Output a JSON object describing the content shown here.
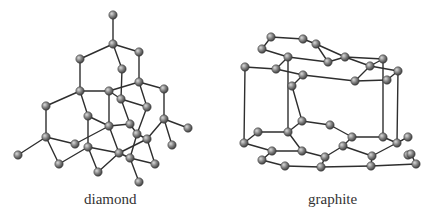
{
  "figure": {
    "panels": [
      {
        "id": "diamond",
        "label": "diamond",
        "atoms": [
          [
            113,
            15
          ],
          [
            113,
            44
          ],
          [
            80,
            59
          ],
          [
            139,
            52
          ],
          [
            122,
            69
          ],
          [
            80,
            91
          ],
          [
            109,
            91
          ],
          [
            139,
            82
          ],
          [
            164,
            89
          ],
          [
            46,
            106
          ],
          [
            121,
            99
          ],
          [
            147,
            107
          ],
          [
            88,
            116
          ],
          [
            109,
            126
          ],
          [
            130,
            124
          ],
          [
            164,
            119
          ],
          [
            188,
            128
          ],
          [
            46,
            137
          ],
          [
            75,
            144
          ],
          [
            88,
            147
          ],
          [
            137,
            134
          ],
          [
            18,
            155
          ],
          [
            119,
            153
          ],
          [
            147,
            139
          ],
          [
            172,
            145
          ],
          [
            59,
            164
          ],
          [
            130,
            158
          ],
          [
            98,
            172
          ],
          [
            155,
            164
          ],
          [
            139,
            182
          ]
        ],
        "bonds": [
          [
            0,
            1
          ],
          [
            1,
            2
          ],
          [
            1,
            3
          ],
          [
            1,
            4
          ],
          [
            2,
            5
          ],
          [
            3,
            7
          ],
          [
            4,
            10
          ],
          [
            5,
            6
          ],
          [
            5,
            9
          ],
          [
            5,
            12
          ],
          [
            7,
            8
          ],
          [
            7,
            11
          ],
          [
            7,
            6
          ],
          [
            6,
            13
          ],
          [
            10,
            11
          ],
          [
            10,
            14
          ],
          [
            10,
            6
          ],
          [
            8,
            15
          ],
          [
            9,
            17
          ],
          [
            12,
            19
          ],
          [
            12,
            13
          ],
          [
            11,
            20
          ],
          [
            15,
            16
          ],
          [
            15,
            24
          ],
          [
            15,
            23
          ],
          [
            13,
            14
          ],
          [
            13,
            22
          ],
          [
            17,
            21
          ],
          [
            17,
            18
          ],
          [
            17,
            25
          ],
          [
            18,
            13
          ],
          [
            19,
            22
          ],
          [
            19,
            27
          ],
          [
            20,
            23
          ],
          [
            20,
            26
          ],
          [
            22,
            23
          ],
          [
            22,
            27
          ],
          [
            22,
            26
          ],
          [
            23,
            28
          ],
          [
            25,
            19
          ],
          [
            26,
            29
          ],
          [
            26,
            28
          ],
          [
            14,
            20
          ]
        ]
      },
      {
        "id": "graphite",
        "label": "graphite",
        "atoms": [
          [
            271,
            37
          ],
          [
            303,
            39
          ],
          [
            262,
            49
          ],
          [
            288,
            57
          ],
          [
            316,
            44
          ],
          [
            328,
            62
          ],
          [
            345,
            57
          ],
          [
            370,
            66
          ],
          [
            383,
            59
          ],
          [
            303,
            75
          ],
          [
            292,
            86
          ],
          [
            245,
            67
          ],
          [
            276,
            69
          ],
          [
            355,
            81
          ],
          [
            387,
            80
          ],
          [
            398,
            71
          ],
          [
            302,
            121
          ],
          [
            330,
            125
          ],
          [
            258,
            132
          ],
          [
            288,
            132
          ],
          [
            352,
            137
          ],
          [
            383,
            137
          ],
          [
            244,
            143
          ],
          [
            272,
            151
          ],
          [
            302,
            151
          ],
          [
            343,
            146
          ],
          [
            397,
            143
          ],
          [
            408,
            137
          ],
          [
            262,
            160
          ],
          [
            285,
            166
          ],
          [
            325,
            157
          ],
          [
            372,
            156
          ],
          [
            408,
            155
          ],
          [
            371,
            166
          ],
          [
            321,
            167
          ],
          [
            411,
            154
          ],
          [
            416,
            164
          ]
        ],
        "bonds": [
          [
            0,
            1
          ],
          [
            0,
            2
          ],
          [
            1,
            4
          ],
          [
            2,
            3
          ],
          [
            4,
            5
          ],
          [
            3,
            5
          ],
          [
            3,
            12
          ],
          [
            5,
            6
          ],
          [
            6,
            8
          ],
          [
            4,
            6
          ],
          [
            8,
            7
          ],
          [
            7,
            13
          ],
          [
            6,
            7
          ],
          [
            12,
            9
          ],
          [
            9,
            10
          ],
          [
            9,
            13
          ],
          [
            13,
            14
          ],
          [
            14,
            15
          ],
          [
            15,
            7
          ],
          [
            11,
            12
          ],
          [
            16,
            17
          ],
          [
            16,
            19
          ],
          [
            17,
            20
          ],
          [
            18,
            19
          ],
          [
            19,
            24
          ],
          [
            20,
            21
          ],
          [
            20,
            25
          ],
          [
            18,
            22
          ],
          [
            22,
            23
          ],
          [
            23,
            24
          ],
          [
            23,
            28
          ],
          [
            28,
            29
          ],
          [
            29,
            34
          ],
          [
            24,
            30
          ],
          [
            30,
            25
          ],
          [
            25,
            31
          ],
          [
            31,
            27
          ],
          [
            27,
            26
          ],
          [
            26,
            21
          ],
          [
            31,
            33
          ],
          [
            33,
            34
          ],
          [
            34,
            30
          ],
          [
            32,
            35
          ],
          [
            35,
            36
          ],
          [
            36,
            33
          ],
          [
            11,
            22
          ],
          [
            3,
            19
          ],
          [
            10,
            16
          ],
          [
            8,
            21
          ],
          [
            15,
            26
          ]
        ]
      }
    ]
  },
  "colors": {
    "atom_fill_light": "#bdbdbd",
    "atom_fill_dark": "#4a4a4a",
    "bond": "#2e2e2e",
    "label": "#333333"
  }
}
